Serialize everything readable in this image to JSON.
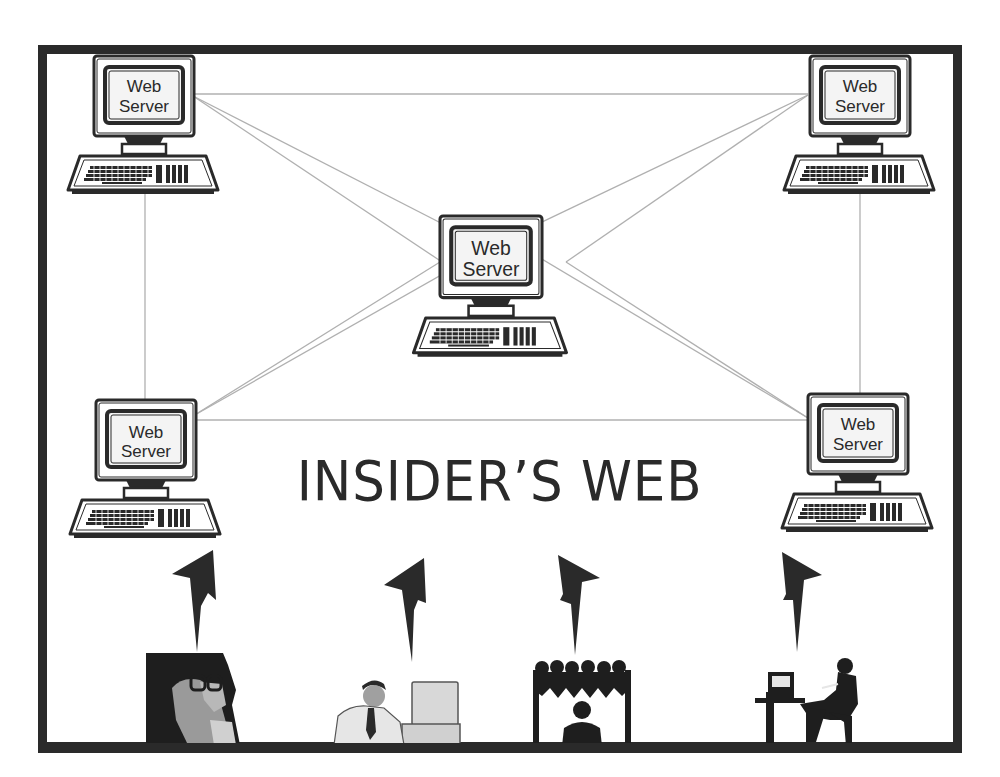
{
  "diagram": {
    "title": "INSIDER’S WEB",
    "nodes": [
      {
        "id": "server-top-left",
        "line1": "Web",
        "line2": "Server"
      },
      {
        "id": "server-top-right",
        "line1": "Web",
        "line2": "Server"
      },
      {
        "id": "server-center",
        "line1": "Web",
        "line2": "Server"
      },
      {
        "id": "server-bottom-left",
        "line1": "Web",
        "line2": "Server"
      },
      {
        "id": "server-bottom-right",
        "line1": "Web",
        "line2": "Server"
      }
    ],
    "edges": [
      [
        "server-top-left",
        "server-top-right"
      ],
      [
        "server-top-left",
        "server-bottom-left"
      ],
      [
        "server-top-right",
        "server-bottom-right"
      ],
      [
        "server-bottom-left",
        "server-bottom-right"
      ],
      [
        "server-top-left",
        "server-center"
      ],
      [
        "server-top-right",
        "server-center"
      ],
      [
        "server-bottom-left",
        "server-center"
      ],
      [
        "server-bottom-right",
        "server-center"
      ]
    ],
    "users": [
      {
        "id": "person-on-phone",
        "description": "man with glasses on telephone"
      },
      {
        "id": "office-worker-at-computer",
        "description": "man in suit at desktop computer"
      },
      {
        "id": "audience-with-speaker",
        "description": "group of people behind a presenter"
      },
      {
        "id": "person-at-desk-on-phone",
        "description": "seated man on phone next to desk with computer"
      }
    ],
    "arrows": 4
  },
  "colors": {
    "ink": "#2a2a2a",
    "line": "#b0b0b0",
    "screen": "#f2f2f2",
    "grey_fill": "#9a9a9a"
  }
}
